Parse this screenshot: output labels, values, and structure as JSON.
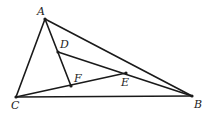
{
  "diagram": {
    "type": "geometry-triangle",
    "points": {
      "A": {
        "x": 45,
        "y": 19,
        "label": "A",
        "lx": 37,
        "ly": 15
      },
      "B": {
        "x": 192,
        "y": 96,
        "label": "B",
        "lx": 194,
        "ly": 108
      },
      "C": {
        "x": 16,
        "y": 97,
        "label": "C",
        "lx": 11,
        "ly": 109
      },
      "D": {
        "x": 58,
        "y": 52,
        "label": "D",
        "lx": 60,
        "ly": 48
      },
      "E": {
        "x": 126,
        "y": 73,
        "label": "E",
        "lx": 121,
        "ly": 86
      },
      "F": {
        "x": 71,
        "y": 86,
        "label": "F",
        "lx": 74,
        "ly": 82
      }
    },
    "segments": [
      [
        "A",
        "B"
      ],
      [
        "A",
        "C"
      ],
      [
        "C",
        "B"
      ],
      [
        "A",
        "F"
      ],
      [
        "D",
        "B"
      ],
      [
        "C",
        "E"
      ]
    ],
    "labels": [
      "A",
      "B",
      "C",
      "D",
      "E",
      "F"
    ]
  }
}
